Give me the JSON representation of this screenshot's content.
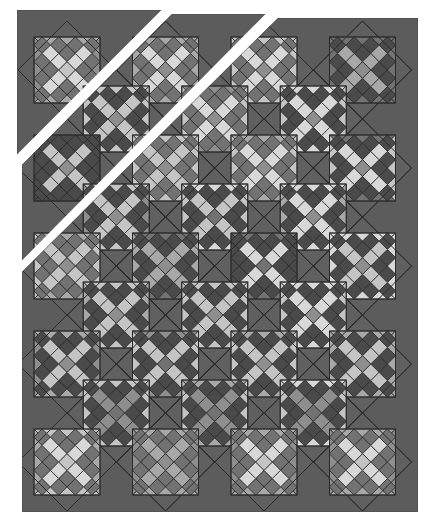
{
  "figure": {
    "width": 432,
    "height": 525
  },
  "palette": {
    "background": "#ffffff",
    "border": "#5c5c5c",
    "setting_dark": "#606060",
    "dark": "#4a4a4a",
    "medium_dark": "#727272",
    "medium": "#8e8e8e",
    "medium_light": "#a8a8a8",
    "light": "#c4c4c4",
    "very_light": "#d8d8d8",
    "cut_line": "#ffffff",
    "seam": "#2a2a2a"
  },
  "panels": [
    {
      "name": "panel-top-left",
      "points": [
        [
          17,
          10
        ],
        [
          163,
          10
        ],
        [
          17,
          157
        ]
      ]
    },
    {
      "name": "panel-middle",
      "points": [
        [
          172,
          14
        ],
        [
          268,
          14
        ],
        [
          22,
          262
        ],
        [
          22,
          165
        ]
      ]
    },
    {
      "name": "panel-main",
      "points": [
        [
          278,
          18
        ],
        [
          418,
          18
        ],
        [
          418,
          512
        ],
        [
          22,
          512
        ],
        [
          22,
          272
        ]
      ]
    }
  ],
  "cut_lines": [
    {
      "name": "cut-line-1",
      "from": [
        15,
        160
      ],
      "to": [
        167,
        8
      ]
    },
    {
      "name": "cut-line-2",
      "from": [
        20,
        266
      ],
      "to": [
        271,
        12
      ]
    }
  ],
  "lattice": {
    "origin_x": 67,
    "origin_y": 70,
    "col_step": 98.5,
    "row_step": 49,
    "half_diag": 49,
    "inner_half": 33,
    "rows": 9,
    "cols_even": 4,
    "cols_odd": 3
  },
  "blocks": [
    {
      "r": 0,
      "c": 0,
      "tb": "medium_light",
      "lr": "medium",
      "x": "very_light",
      "xc": "light",
      "k": "medium_dark"
    },
    {
      "r": 0,
      "c": 1,
      "tb": "medium_light",
      "lr": "medium_light",
      "x": "very_light",
      "xc": "medium",
      "k": "medium_dark"
    },
    {
      "r": 0,
      "c": 2,
      "tb": "light",
      "lr": "light",
      "x": "very_light",
      "xc": "medium",
      "k": "medium_dark"
    },
    {
      "r": 0,
      "c": 3,
      "tb": "medium_dark",
      "lr": "medium_dark",
      "x": "medium_light",
      "xc": "medium",
      "k": "dark"
    },
    {
      "r": 1,
      "c": 0,
      "tb": "light",
      "lr": "light",
      "x": "light",
      "xc": "medium",
      "k": "dark"
    },
    {
      "r": 1,
      "c": 1,
      "tb": "medium",
      "lr": "light",
      "x": "very_light",
      "xc": "medium",
      "k": "medium_dark"
    },
    {
      "r": 1,
      "c": 2,
      "tb": "very_light",
      "lr": "light",
      "x": "very_light",
      "xc": "medium",
      "k": "dark"
    },
    {
      "r": 2,
      "c": 0,
      "tb": "dark",
      "lr": "dark",
      "x": "light",
      "xc": "medium",
      "k": "dark"
    },
    {
      "r": 2,
      "c": 1,
      "tb": "light",
      "lr": "light",
      "x": "light",
      "xc": "medium",
      "k": "medium_dark"
    },
    {
      "r": 2,
      "c": 2,
      "tb": "medium_light",
      "lr": "light",
      "x": "very_light",
      "xc": "medium",
      "k": "medium_dark"
    },
    {
      "r": 2,
      "c": 3,
      "tb": "medium_dark",
      "lr": "light",
      "x": "very_light",
      "xc": "medium",
      "k": "dark"
    },
    {
      "r": 3,
      "c": 0,
      "tb": "light",
      "lr": "medium",
      "x": "light",
      "xc": "medium",
      "k": "dark"
    },
    {
      "r": 3,
      "c": 1,
      "tb": "very_light",
      "lr": "light",
      "x": "light",
      "xc": "medium_dark",
      "k": "dark"
    },
    {
      "r": 3,
      "c": 2,
      "tb": "very_light",
      "lr": "medium_light",
      "x": "very_light",
      "xc": "medium",
      "k": "dark"
    },
    {
      "r": 4,
      "c": 0,
      "tb": "medium_light",
      "lr": "light",
      "x": "light",
      "xc": "medium",
      "k": "medium_dark"
    },
    {
      "r": 4,
      "c": 1,
      "tb": "medium_dark",
      "lr": "medium_light",
      "x": "medium_light",
      "xc": "medium",
      "k": "dark"
    },
    {
      "r": 4,
      "c": 2,
      "tb": "medium_dark",
      "lr": "dark",
      "x": "very_light",
      "xc": "medium_dark",
      "k": "dark"
    },
    {
      "r": 4,
      "c": 3,
      "tb": "very_light",
      "lr": "very_light",
      "x": "light",
      "xc": "medium",
      "k": "dark"
    },
    {
      "r": 5,
      "c": 0,
      "tb": "light",
      "lr": "medium_light",
      "x": "light",
      "xc": "medium",
      "k": "dark"
    },
    {
      "r": 5,
      "c": 1,
      "tb": "light",
      "lr": "light",
      "x": "light",
      "xc": "medium",
      "k": "dark"
    },
    {
      "r": 5,
      "c": 2,
      "tb": "very_light",
      "lr": "light",
      "x": "very_light",
      "xc": "medium",
      "k": "dark"
    },
    {
      "r": 6,
      "c": 0,
      "tb": "medium_light",
      "lr": "medium",
      "x": "light",
      "xc": "medium",
      "k": "dark"
    },
    {
      "r": 6,
      "c": 1,
      "tb": "medium",
      "lr": "light",
      "x": "light",
      "xc": "medium_dark",
      "k": "dark"
    },
    {
      "r": 6,
      "c": 2,
      "tb": "medium_light",
      "lr": "light",
      "x": "light",
      "xc": "medium",
      "k": "dark"
    },
    {
      "r": 6,
      "c": 3,
      "tb": "medium_light",
      "lr": "medium_light",
      "x": "light",
      "xc": "medium",
      "k": "dark"
    },
    {
      "r": 7,
      "c": 0,
      "tb": "light",
      "lr": "light",
      "x": "medium",
      "xc": "medium_dark",
      "k": "dark"
    },
    {
      "r": 7,
      "c": 1,
      "tb": "medium_light",
      "lr": "light",
      "x": "medium",
      "xc": "medium_dark",
      "k": "dark"
    },
    {
      "r": 7,
      "c": 2,
      "tb": "very_light",
      "lr": "light",
      "x": "medium",
      "xc": "medium_dark",
      "k": "dark"
    },
    {
      "r": 8,
      "c": 0,
      "tb": "light",
      "lr": "medium_light",
      "x": "very_light",
      "xc": "light",
      "k": "medium_dark"
    },
    {
      "r": 8,
      "c": 1,
      "tb": "medium_light",
      "lr": "medium",
      "x": "medium_light",
      "xc": "medium",
      "k": "medium_dark"
    },
    {
      "r": 8,
      "c": 2,
      "tb": "medium_light",
      "lr": "medium",
      "x": "very_light",
      "xc": "light",
      "k": "medium_dark"
    },
    {
      "r": 8,
      "c": 3,
      "tb": "medium_light",
      "lr": "medium",
      "x": "very_light",
      "xc": "light",
      "k": "medium_dark"
    }
  ]
}
